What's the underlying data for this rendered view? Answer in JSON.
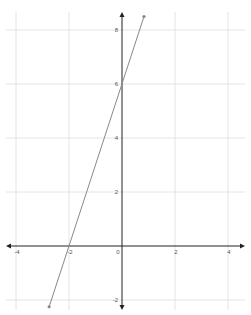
{
  "chart_data": {
    "type": "line",
    "title": "",
    "xlabel": "",
    "ylabel": "",
    "xlim": [
      -4.3,
      4.6
    ],
    "ylim": [
      -2.5,
      8.9
    ],
    "grid": true,
    "x_ticks": [
      -4,
      -2,
      0,
      2,
      4
    ],
    "y_ticks": [
      -2,
      2,
      4,
      6,
      8
    ],
    "x_tick_labels": [
      "-4",
      "-2",
      "0",
      "2",
      "4"
    ],
    "y_tick_labels": [
      "-2",
      "2",
      "4",
      "6",
      "8"
    ],
    "series": [
      {
        "name": "y = 3x + 6",
        "equation": "y = 3x + 6",
        "x": [
          -2.75,
          0.83
        ],
        "y": [
          -2.25,
          8.5
        ],
        "color": "#888888",
        "endpoints_marked": true
      }
    ],
    "key_points": [
      {
        "label": "x-intercept",
        "x": -2,
        "y": 0
      },
      {
        "label": "y-intercept",
        "x": 0,
        "y": 6
      }
    ]
  },
  "colors": {
    "axis": "#222222",
    "grid": "#dddddd",
    "line": "#888888"
  }
}
